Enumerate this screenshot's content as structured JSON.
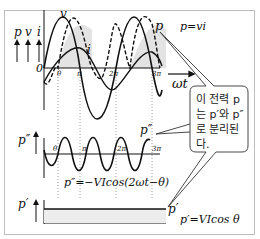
{
  "diagram": {
    "axis_labels": {
      "p": "p",
      "v": "v",
      "i": "i",
      "origin": "0",
      "omega_t": "ωt"
    },
    "top_plot": {
      "curve_labels": {
        "v": "v",
        "i": "i",
        "p": "p"
      },
      "formula": "p=vi",
      "ticks": [
        "θ",
        "π",
        "2π",
        "3π"
      ]
    },
    "middle_plot": {
      "axis_label": "p″",
      "curve_label": "p″",
      "ticks": [
        "θ",
        "π",
        "2π",
        "3π"
      ],
      "formula": "p″=−VIcos(2ωt−θ)"
    },
    "bottom_plot": {
      "axis_label": "p′",
      "curve_label": "p′",
      "formula": "p′=VIcos θ"
    },
    "callout": {
      "lines": [
        "이 전력 p",
        "는 p′와 p″",
        "로 분리된",
        "다."
      ]
    },
    "colors": {
      "line": "#111111",
      "shade": "#d9d9d9",
      "border": "#bdbdbd",
      "guide": "#888888"
    }
  }
}
